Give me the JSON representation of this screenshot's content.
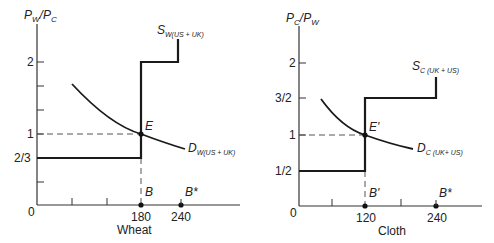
{
  "panels": [
    {
      "id": "wheat",
      "y_axis_label": {
        "main": "P",
        "sub1": "W",
        "slash": "/",
        "main2": "P",
        "sub2": "C"
      },
      "x_axis_label": "Wheat",
      "origin_label": "0",
      "y_ticks": [
        {
          "label": "2",
          "value": 2
        },
        {
          "label": "1",
          "value": 1
        },
        {
          "label": "2/3",
          "value": 0.667
        }
      ],
      "x_ticks": [
        {
          "label": "180",
          "value": 180
        },
        {
          "label": "240",
          "value": 240
        }
      ],
      "supply_label": {
        "main": "S",
        "sub": "W(US + UK)"
      },
      "demand_label": {
        "main": "D",
        "sub": "W(US + UK)"
      },
      "equilibrium_label": "E",
      "point_labels": {
        "b": "B",
        "bstar": "B*"
      }
    },
    {
      "id": "cloth",
      "y_axis_label": {
        "main": "P",
        "sub1": "C",
        "slash": "/",
        "main2": "P",
        "sub2": "W"
      },
      "x_axis_label": "Cloth",
      "origin_label": "0",
      "y_ticks": [
        {
          "label": "2",
          "value": 2
        },
        {
          "label": "3/2",
          "value": 1.5
        },
        {
          "label": "1",
          "value": 1
        },
        {
          "label": "1/2",
          "value": 0.5
        }
      ],
      "x_ticks": [
        {
          "label": "120",
          "value": 120
        },
        {
          "label": "240",
          "value": 240
        }
      ],
      "supply_label": {
        "main": "S",
        "sub": "C (UK + US)"
      },
      "demand_label": {
        "main": "D",
        "sub": "C (UK+ US)"
      },
      "equilibrium_label": "E'",
      "point_labels": {
        "b": "B'",
        "bstar": "B*"
      }
    }
  ],
  "colors": {
    "line": "#1a1a1a",
    "dashed": "#444444",
    "axis": "#333333"
  }
}
